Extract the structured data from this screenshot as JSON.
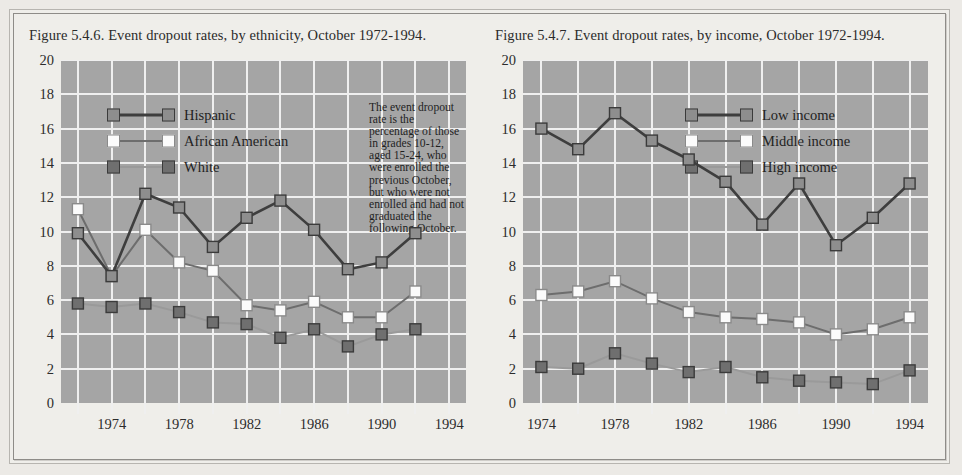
{
  "figures": [
    {
      "title": "Figure 5.4.6. Event dropout rates, by ethnicity, October 1972-1994.",
      "annotation": "The event dropout rate is the percentage of those in grades 10-12, aged 15-24, who were enrolled the previous October, but who were not enrolled and had not graduated the following October.",
      "chart_data": {
        "type": "line",
        "title": "Figure 5.4.6. Event dropout rates, by ethnicity, October 1972-1994.",
        "xlabel": "",
        "ylabel": "",
        "ylim": [
          0,
          20
        ],
        "ytick_labels": [
          "0",
          "2",
          "4",
          "6",
          "8",
          "10",
          "12",
          "14",
          "16",
          "18",
          "20"
        ],
        "ytick_values": [
          0,
          2,
          4,
          6,
          8,
          10,
          12,
          14,
          16,
          18,
          20
        ],
        "x": [
          1972,
          1974,
          1976,
          1978,
          1980,
          1982,
          1984,
          1986,
          1988,
          1990,
          1992,
          1994
        ],
        "xtick_labels": [
          "1974",
          "1978",
          "1982",
          "1986",
          "1990",
          "1994"
        ],
        "xtick_values": [
          1974,
          1978,
          1982,
          1986,
          1990,
          1994
        ],
        "grid": true,
        "legend_position": "upper-left",
        "series": [
          {
            "name": "Hispanic",
            "color": "#8e8e8e",
            "line_color": "#3e3e3e",
            "values": [
              9.9,
              7.4,
              12.2,
              11.4,
              9.1,
              10.8,
              11.8,
              10.1,
              7.8,
              8.2,
              9.9
            ]
          },
          {
            "name": "African American",
            "color": "#fbfbfb",
            "line_color": "#6d6d6d",
            "values": [
              11.3,
              7.4,
              10.1,
              8.2,
              7.7,
              5.7,
              5.4,
              5.9,
              5.0,
              5.0,
              6.5
            ]
          },
          {
            "name": "White",
            "color": "#6f6f6f",
            "line_color": "#9a9a9a",
            "values": [
              5.8,
              5.6,
              5.8,
              5.3,
              4.7,
              4.6,
              3.8,
              4.3,
              3.3,
              4.0,
              4.3
            ]
          }
        ]
      }
    },
    {
      "title": "Figure 5.4.7. Event dropout rates, by income, October 1972-1994.",
      "annotation": "",
      "chart_data": {
        "type": "line",
        "title": "Figure 5.4.7. Event dropout rates, by income, October 1972-1994.",
        "xlabel": "",
        "ylabel": "",
        "ylim": [
          0,
          20
        ],
        "ytick_labels": [
          "0",
          "2",
          "4",
          "6",
          "8",
          "10",
          "12",
          "14",
          "16",
          "18",
          "20"
        ],
        "ytick_values": [
          0,
          2,
          4,
          6,
          8,
          10,
          12,
          14,
          16,
          18,
          20
        ],
        "x": [
          1974,
          1976,
          1978,
          1980,
          1982,
          1984,
          1986,
          1988,
          1990,
          1992,
          1994
        ],
        "xtick_labels": [
          "1974",
          "1978",
          "1982",
          "1986",
          "1990",
          "1994"
        ],
        "xtick_values": [
          1974,
          1978,
          1982,
          1986,
          1990,
          1994
        ],
        "grid": true,
        "legend_position": "upper-center",
        "series": [
          {
            "name": "Low income",
            "color": "#8e8e8e",
            "line_color": "#3e3e3e",
            "values": [
              16.0,
              14.8,
              16.9,
              15.3,
              14.2,
              12.9,
              10.4,
              12.8,
              9.2,
              10.8,
              12.8
            ]
          },
          {
            "name": "Middle income",
            "color": "#fbfbfb",
            "line_color": "#6d6d6d",
            "values": [
              6.3,
              6.5,
              7.1,
              6.1,
              5.3,
              5.0,
              4.9,
              4.7,
              4.0,
              4.3,
              5.0
            ]
          },
          {
            "name": "High income",
            "color": "#6f6f6f",
            "line_color": "#9a9a9a",
            "values": [
              2.1,
              2.0,
              2.9,
              2.3,
              1.8,
              2.1,
              1.5,
              1.3,
              1.2,
              1.1,
              1.9
            ]
          }
        ]
      }
    }
  ],
  "style": {
    "plot_background": "#a5a5a5",
    "grid_color": "#efefef",
    "page_background": "#efeeea",
    "text_color": "#2c2c2c"
  }
}
